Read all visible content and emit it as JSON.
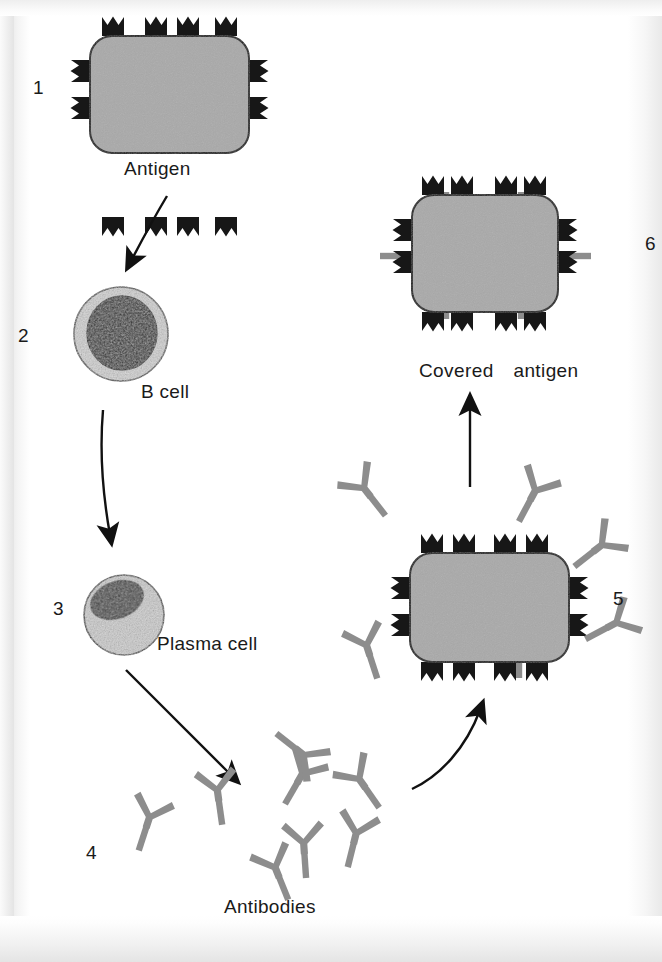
{
  "figure": {
    "background_color": "#ffffff",
    "ink_color": "#1a1a1a",
    "antigen_body_color": "#a9a9a9",
    "antigen_spike_color": "#1a1a1a",
    "antibody_color": "#8d8d8d",
    "cell_cytoplasm_color": "#c9c9c9",
    "cell_nucleus_color": "#2b2b2b"
  },
  "steps": [
    {
      "number": "1",
      "label": "Antigen",
      "element": "antigen",
      "description": "Antigen with surface epitope spikes"
    },
    {
      "number": "2",
      "label": "B cell",
      "element": "b-cell",
      "description": "B cell with large dark nucleus"
    },
    {
      "number": "3",
      "label": "Plasma cell",
      "element": "plasma-cell",
      "description": "Plasma cell with eccentric nucleus"
    },
    {
      "number": "4",
      "label": "Antibodies",
      "element": "antibodies",
      "description": "Free Y-shaped antibodies",
      "count": 8
    },
    {
      "number": "5",
      "label": "",
      "element": "antigen-binding",
      "description": "Antibodies binding to antigen epitopes",
      "free_antibody_count": 5,
      "bound_antibody_count": 2
    },
    {
      "number": "6",
      "label": "Covered antigen",
      "element": "covered-antigen",
      "description": "Antigen fully covered by bound antibodies",
      "bound_antibody_count": 6
    }
  ],
  "arrows": [
    {
      "name": "antigen-to-bcell",
      "from": "1",
      "to": "2",
      "style": "curved"
    },
    {
      "name": "bcell-to-plasmacell",
      "from": "2",
      "to": "3",
      "style": "curved"
    },
    {
      "name": "plasmacell-to-antibodies",
      "from": "3",
      "to": "4",
      "style": "straight"
    },
    {
      "name": "antibodies-to-binding",
      "from": "4",
      "to": "5",
      "style": "curved"
    },
    {
      "name": "binding-to-covered",
      "from": "5",
      "to": "6",
      "style": "straight"
    }
  ]
}
